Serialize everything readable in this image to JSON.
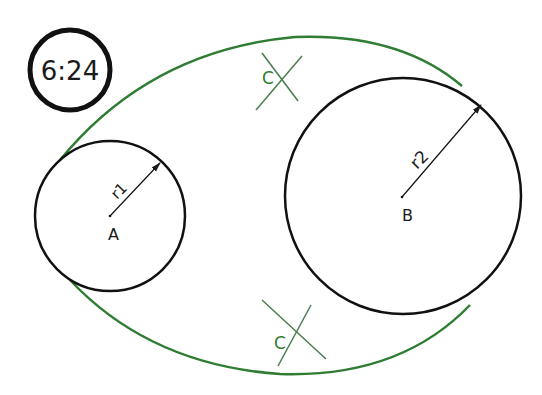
{
  "badge": {
    "text": "6:24"
  },
  "circles": {
    "a": {
      "label": "A",
      "radius_label": "r1"
    },
    "b": {
      "label": "B",
      "radius_label": "r2"
    }
  },
  "construction": {
    "top_mark": "C",
    "bottom_mark": "C"
  },
  "colors": {
    "ink": "#1a1a1a",
    "green": "#2e7d32"
  }
}
